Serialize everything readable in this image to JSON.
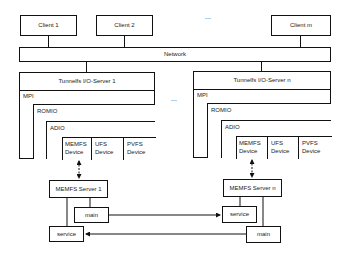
{
  "clients": [
    {
      "label": "Client 1"
    },
    {
      "label": "Client 2"
    },
    {
      "label": "Client m"
    }
  ],
  "ellipsis": "...",
  "network": {
    "label": "Network"
  },
  "servers": [
    {
      "title": "Tunnelfs I/O-Server 1",
      "mpi": "MPI",
      "romio": "ROMIO",
      "adio": "ADIO",
      "devices": [
        {
          "line1": "MEMFS",
          "line2": "Device"
        },
        {
          "line1": "UFS",
          "line2": "Device"
        },
        {
          "line1": "PVFS",
          "line2": "Device"
        }
      ],
      "memfs_server": "MEMFS Server 1",
      "main": "main",
      "service": "service"
    },
    {
      "title": "Tunnelfs I/O-Server n",
      "mpi": "MPI",
      "romio": "ROMIO",
      "adio": "ADIO",
      "devices": [
        {
          "line1": "MEMFS",
          "line2": "Device"
        },
        {
          "line1": "UFS",
          "line2": "Device"
        },
        {
          "line1": "PVFS",
          "line2": "Device"
        }
      ],
      "memfs_server": "MEMFS Server n",
      "main": "main",
      "service": "service"
    }
  ]
}
